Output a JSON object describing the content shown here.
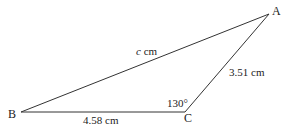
{
  "diagram": {
    "type": "triangle",
    "vertices": {
      "A": {
        "label": "A",
        "x": 269,
        "y": 14
      },
      "B": {
        "label": "B",
        "x": 21,
        "y": 112
      },
      "C": {
        "label": "C",
        "x": 185,
        "y": 112
      }
    },
    "sides": {
      "AB": {
        "label_var": "c",
        "label_unit": " cm"
      },
      "BC": {
        "label": "4.58 cm"
      },
      "CA": {
        "label": "3.51 cm"
      }
    },
    "angles": {
      "C": {
        "label": "130°"
      }
    },
    "colors": {
      "line": "#333333",
      "text": "#222222"
    }
  }
}
